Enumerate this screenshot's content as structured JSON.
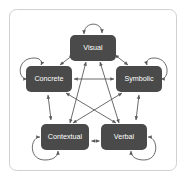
{
  "diagram": {
    "frame": {
      "border_color": "#d0d0d0",
      "background": "#ffffff"
    },
    "style": {
      "node_fill": "#4a4a4a",
      "node_text_color": "#ffffff",
      "edge_color": "#5a5a5a"
    },
    "nodes": [
      {
        "id": "visual",
        "label": "Visual",
        "x": 93,
        "y": 48,
        "w": 46,
        "h": 26
      },
      {
        "id": "concrete",
        "label": "Concrete",
        "x": 49,
        "y": 79,
        "w": 46,
        "h": 26
      },
      {
        "id": "symbolic",
        "label": "Symbolic",
        "x": 139,
        "y": 79,
        "w": 46,
        "h": 26
      },
      {
        "id": "contextual",
        "label": "Contextual",
        "x": 65,
        "y": 137,
        "w": 48,
        "h": 26
      },
      {
        "id": "verbal",
        "label": "Verbal",
        "x": 124,
        "y": 137,
        "w": 46,
        "h": 26
      }
    ],
    "edges": [
      {
        "from": "concrete",
        "to": "symbolic",
        "arrow": "double"
      },
      {
        "from": "contextual",
        "to": "verbal",
        "arrow": "double"
      },
      {
        "from": "visual",
        "to": "contextual",
        "arrow": "double"
      },
      {
        "from": "visual",
        "to": "verbal",
        "arrow": "double"
      },
      {
        "from": "concrete",
        "to": "verbal",
        "arrow": "double"
      },
      {
        "from": "symbolic",
        "to": "contextual",
        "arrow": "double"
      },
      {
        "from": "concrete",
        "to": "visual",
        "arrow": "double"
      },
      {
        "from": "symbolic",
        "to": "visual",
        "arrow": "double"
      },
      {
        "from": "concrete",
        "to": "contextual",
        "arrow": "double"
      },
      {
        "from": "symbolic",
        "to": "verbal",
        "arrow": "double"
      }
    ],
    "self_loops": [
      {
        "node": "visual",
        "position": "top"
      },
      {
        "node": "concrete",
        "position": "left"
      },
      {
        "node": "symbolic",
        "position": "right"
      },
      {
        "node": "contextual",
        "position": "bottom-left"
      },
      {
        "node": "verbal",
        "position": "bottom-right"
      }
    ]
  }
}
